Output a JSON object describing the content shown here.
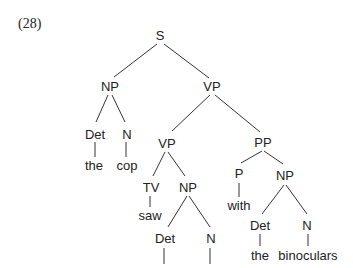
{
  "example_number": "(28)",
  "nodes": {
    "s": "S",
    "np_subj": "NP",
    "det_subj": "Det",
    "n_subj": "N",
    "w_the1": "the",
    "w_cop": "cop",
    "vp_top": "VP",
    "vp_inner": "VP",
    "tv": "TV",
    "w_saw": "saw",
    "np_obj": "NP",
    "det_obj": "Det",
    "n_obj": "N",
    "pp": "PP",
    "p": "P",
    "w_with": "with",
    "np_pp": "NP",
    "det_pp": "Det",
    "n_pp": "N",
    "w_the2": "the",
    "w_binoculars": "binoculars"
  }
}
